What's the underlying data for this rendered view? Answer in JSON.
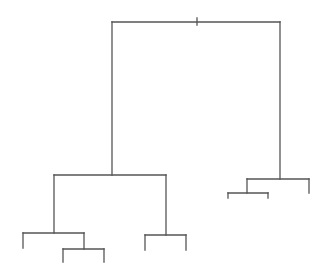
{
  "diagram": {
    "type": "dendrogram",
    "title": "",
    "line_color": "#555555",
    "background": "#ffffff",
    "root_marker": "tick",
    "tree": {
      "id": "root",
      "children": [
        {
          "id": "cluster-left",
          "children": [
            {
              "id": "cluster-left-a",
              "children": [
                {
                  "id": "leaf-1"
                },
                {
                  "id": "cluster-left-a2",
                  "children": [
                    {
                      "id": "leaf-2"
                    },
                    {
                      "id": "leaf-3"
                    }
                  ]
                }
              ]
            },
            {
              "id": "cluster-left-b",
              "children": [
                {
                  "id": "leaf-4"
                },
                {
                  "id": "leaf-5"
                }
              ]
            }
          ]
        },
        {
          "id": "cluster-right",
          "children": [
            {
              "id": "cluster-right-a",
              "children": [
                {
                  "id": "leaf-6"
                },
                {
                  "id": "leaf-7"
                }
              ]
            },
            {
              "id": "leaf-8"
            }
          ]
        }
      ]
    }
  }
}
